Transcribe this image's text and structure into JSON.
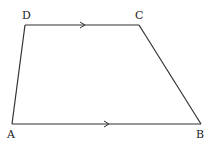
{
  "diagram": {
    "type": "trapezoid",
    "vertices": {
      "A": {
        "label": "A",
        "x": 12,
        "y": 124
      },
      "B": {
        "label": "B",
        "x": 201,
        "y": 124
      },
      "C": {
        "label": "C",
        "x": 139,
        "y": 25
      },
      "D": {
        "label": "D",
        "x": 25,
        "y": 25
      }
    },
    "labels": {
      "A": "A",
      "B": "B",
      "C": "C",
      "D": "D"
    },
    "edges": [
      {
        "from": "A",
        "to": "B",
        "parallel_mark": true
      },
      {
        "from": "B",
        "to": "C",
        "parallel_mark": false
      },
      {
        "from": "C",
        "to": "D",
        "parallel_mark": true
      },
      {
        "from": "D",
        "to": "A",
        "parallel_mark": false
      }
    ],
    "parallel_sides": [
      "DC",
      "AB"
    ],
    "colors": {
      "line": "#333333",
      "text": "#222222",
      "background": "#ffffff"
    }
  }
}
